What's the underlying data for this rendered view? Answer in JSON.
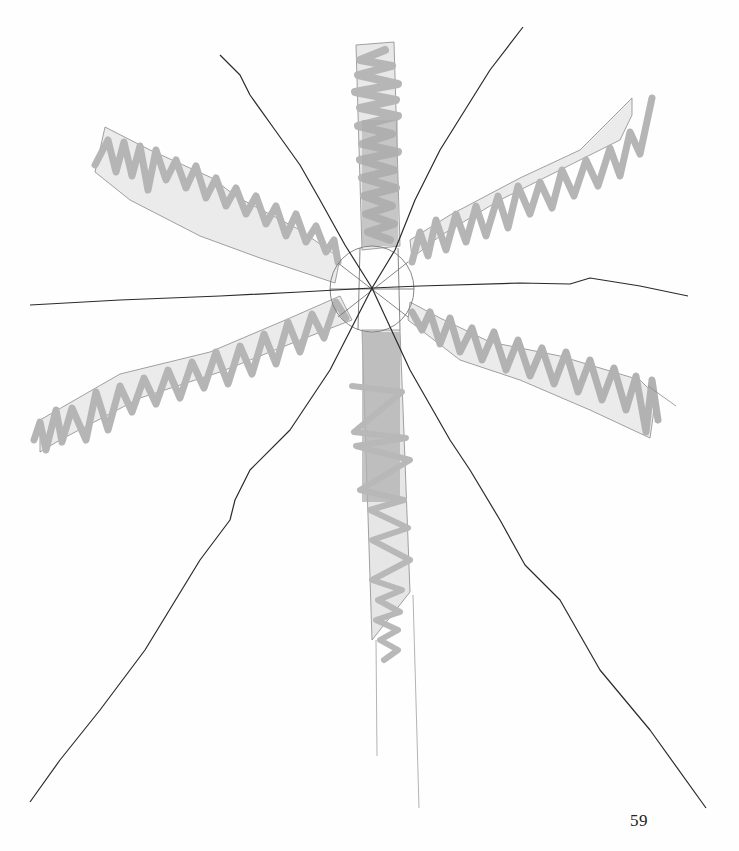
{
  "page": {
    "number": "59"
  },
  "artwork": {
    "type": "radial pencil and marker drawing",
    "colors": {
      "ink_line": "#2b2b2b",
      "outline": "#8a8a8a",
      "band_fill": "#e6e6e6",
      "marker": "#b9b9b9",
      "marker_dark": "#a8a8a8"
    },
    "center": [
      372,
      288
    ],
    "ink_rays": [
      {
        "name": "ray-top-left",
        "from": [
          220,
          55
        ],
        "to": [
          372,
          288
        ]
      },
      {
        "name": "ray-top-right",
        "from": [
          523,
          27
        ],
        "to": [
          372,
          288
        ]
      },
      {
        "name": "ray-left",
        "from": [
          30,
          305
        ],
        "to": [
          372,
          288
        ]
      },
      {
        "name": "ray-right",
        "from": [
          688,
          296
        ],
        "to": [
          372,
          288
        ]
      },
      {
        "name": "ray-bottom-left",
        "from": [
          30,
          802
        ],
        "to": [
          372,
          288
        ]
      },
      {
        "name": "ray-bottom-right",
        "from": [
          706,
          808
        ],
        "to": [
          372,
          288
        ]
      }
    ],
    "shaded_bands": [
      {
        "name": "band-top",
        "direction": "up"
      },
      {
        "name": "band-bottom",
        "direction": "down"
      },
      {
        "name": "band-upper-left",
        "direction": "upper-left"
      },
      {
        "name": "band-upper-right",
        "direction": "upper-right"
      },
      {
        "name": "band-lower-left",
        "direction": "lower-left"
      },
      {
        "name": "band-lower-right",
        "direction": "lower-right"
      }
    ]
  }
}
